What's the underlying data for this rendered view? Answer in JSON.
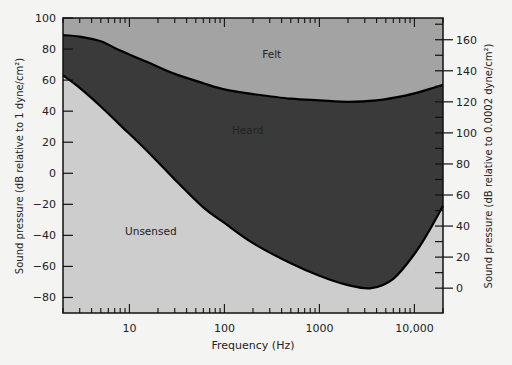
{
  "chart_data": {
    "type": "area",
    "title": "",
    "xlabel": "Frequency (Hz)",
    "ylabel": "Sound pressure (dB relative to 1 dyne/cm²)",
    "ylabel_right": "Sound pressure (dB relative to 0.0002 dyne/cm²)",
    "xscale": "log",
    "xlim": [
      2,
      20000
    ],
    "ylim": [
      -90,
      100
    ],
    "ylim_right": [
      -16,
      174
    ],
    "x_ticks": [
      10,
      100,
      1000,
      10000
    ],
    "x_tick_labels": [
      "10",
      "100",
      "1000",
      "10,000"
    ],
    "y_ticks": [
      100,
      80,
      60,
      40,
      20,
      0,
      -20,
      -40,
      -60,
      -80
    ],
    "y_tick_labels": [
      "100",
      "80",
      "60",
      "40",
      "20",
      "0",
      "-20",
      "-40",
      "-60",
      "-80"
    ],
    "y_right_ticks": [
      160,
      140,
      120,
      100,
      80,
      60,
      40,
      20,
      0
    ],
    "y_right_tick_labels": [
      "160",
      "140",
      "120",
      "100",
      "80",
      "60",
      "40",
      "20",
      "0"
    ],
    "grid": false,
    "regions": [
      {
        "name": "Felt",
        "color": "#a3a3a3",
        "label_x_hz": 250,
        "label_y_db": 74
      },
      {
        "name": "Heard",
        "color": "#3a3a3a",
        "label_x_hz": 120,
        "label_y_db": 25
      },
      {
        "name": "Unsensed",
        "color": "#cdcdcd",
        "label_x_hz": 9,
        "label_y_db": -40
      }
    ],
    "series": [
      {
        "name": "Threshold of feeling",
        "x": [
          2,
          3,
          5,
          8,
          15,
          30,
          60,
          100,
          200,
          500,
          1000,
          2000,
          4000,
          8000,
          14000,
          20000
        ],
        "values": [
          89,
          88,
          85,
          79,
          72,
          64,
          58,
          54,
          51,
          48,
          47,
          46,
          47,
          50,
          54,
          57
        ]
      },
      {
        "name": "Threshold of hearing",
        "x": [
          2,
          3,
          5,
          8,
          15,
          30,
          60,
          100,
          200,
          500,
          1000,
          2000,
          3500,
          6000,
          10000,
          14000,
          20000
        ],
        "values": [
          63,
          55,
          43,
          31,
          15,
          -4,
          -22,
          -32,
          -45,
          -58,
          -66,
          -72,
          -74,
          -68,
          -52,
          -38,
          -21
        ]
      }
    ]
  }
}
